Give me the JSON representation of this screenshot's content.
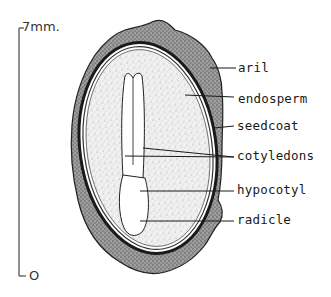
{
  "figure": {
    "scale_bar": {
      "top_label": "7mm.",
      "bottom_label": "O"
    },
    "labels": [
      {
        "id": "aril",
        "text": "aril"
      },
      {
        "id": "endosperm",
        "text": "endosperm"
      },
      {
        "id": "seedcoat",
        "text": "seedcoat"
      },
      {
        "id": "cotyledons",
        "text": "cotyledons"
      },
      {
        "id": "hypocotyl",
        "text": "hypocotyl"
      },
      {
        "id": "radicle",
        "text": "radicle"
      }
    ],
    "colors": {
      "ink": "#1a1a1a",
      "aril_fill": "#8a8a8a",
      "endosperm_fill": "#e6e6e6",
      "embryo_fill": "#ffffff",
      "background": "#ffffff"
    }
  }
}
